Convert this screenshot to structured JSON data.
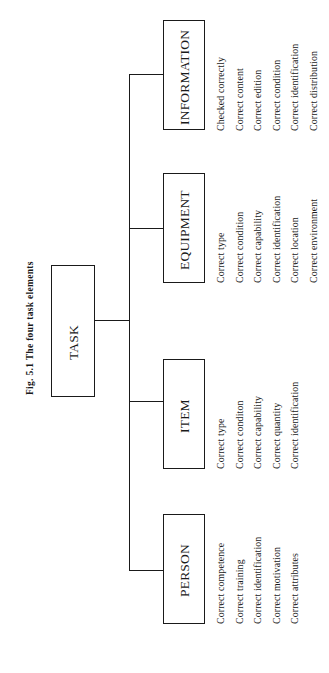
{
  "title": "Fig. 5.1 The four task elements",
  "root": {
    "label": "TASK"
  },
  "elements": [
    {
      "label": "PERSON",
      "attributes": [
        "Correct competence",
        "Correct training",
        "Correct identification",
        "Correct motivation",
        "Correct attributes"
      ]
    },
    {
      "label": "ITEM",
      "attributes": [
        "Correct type",
        "Correct conditon",
        "Correct capability",
        "Correct quantity",
        "Correct identification"
      ]
    },
    {
      "label": "EQUIPMENT",
      "attributes": [
        "Correct type",
        "Correct condition",
        "Correct capability",
        "Correct identification",
        "Correct location",
        "Correct environment"
      ]
    },
    {
      "label": "INFORMATION",
      "attributes": [
        "Checked correctly",
        "Correct content",
        "Correct edition",
        "Correct condition",
        "Correct identification",
        "Correct distribution"
      ]
    }
  ],
  "colors": {
    "line": "#1a1a1a",
    "background": "#ffffff"
  }
}
